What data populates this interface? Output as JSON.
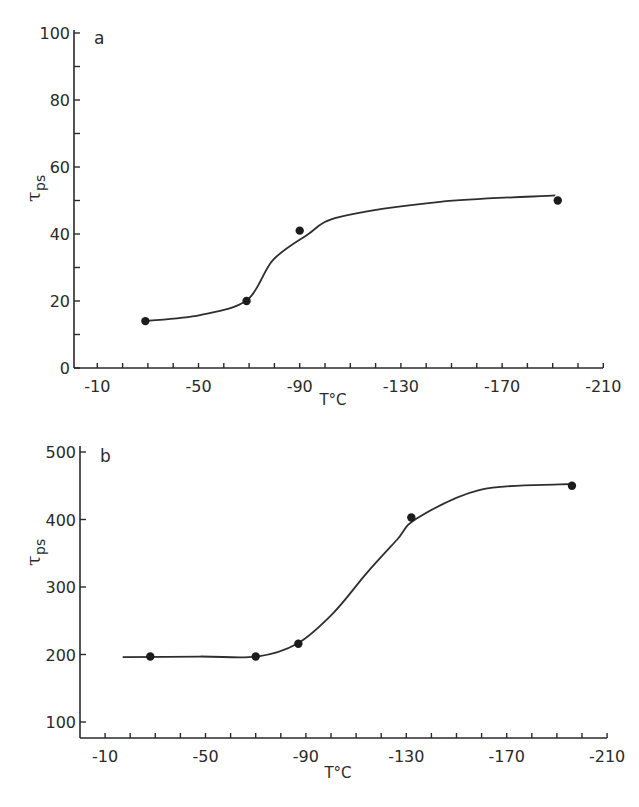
{
  "chart_data": [
    {
      "type": "scatter",
      "panel_label": "a",
      "title": "",
      "xlabel": "T°C",
      "ylabel": "τ",
      "ylabel_subscript": "ps",
      "xlim": [
        0,
        -210
      ],
      "ylim": [
        0,
        100
      ],
      "x_ticks_major": [
        -10,
        -50,
        -90,
        -130,
        -170,
        -210
      ],
      "x_tick_labels": [
        "-10",
        "-50",
        "-90",
        "-130",
        "-170",
        "-210"
      ],
      "x_ticks_minor_step": -10,
      "y_ticks_major": [
        0,
        20,
        40,
        60,
        80,
        100
      ],
      "y_tick_labels": [
        "0",
        "20",
        "40",
        "60",
        "80",
        "100"
      ],
      "y_ticks_minor_step": 10,
      "grid": false,
      "points": [
        {
          "x": -29,
          "y": 14
        },
        {
          "x": -69,
          "y": 20
        },
        {
          "x": -90,
          "y": 41
        },
        {
          "x": -192,
          "y": 50
        }
      ],
      "fit_curve": [
        {
          "x": -29,
          "y": 14
        },
        {
          "x": -50.6,
          "y": 15.8
        },
        {
          "x": -69.2,
          "y": 20.3
        },
        {
          "x": -79.4,
          "y": 32.2
        },
        {
          "x": -92.9,
          "y": 39.7
        },
        {
          "x": -105.9,
          "y": 45.1
        },
        {
          "x": -145.5,
          "y": 49.6
        },
        {
          "x": -191,
          "y": 51.5
        }
      ]
    },
    {
      "type": "scatter",
      "panel_label": "b",
      "title": "",
      "xlabel": "T°C",
      "ylabel": "τ",
      "ylabel_subscript": "ps",
      "xlim": [
        0,
        -210
      ],
      "ylim": [
        76,
        500
      ],
      "x_ticks_major": [
        -10,
        -50,
        -90,
        -130,
        -170,
        -210
      ],
      "x_tick_labels": [
        "-10",
        "-50",
        "-90",
        "-130",
        "-170",
        "-210"
      ],
      "x_ticks_minor_step": -10,
      "y_ticks_major": [
        100,
        200,
        300,
        400,
        500
      ],
      "y_tick_labels": [
        "100",
        "200",
        "300",
        "400",
        "500"
      ],
      "grid": false,
      "points": [
        {
          "x": -28,
          "y": 197
        },
        {
          "x": -70,
          "y": 197
        },
        {
          "x": -87,
          "y": 216
        },
        {
          "x": -132,
          "y": 403
        },
        {
          "x": -196,
          "y": 450
        }
      ],
      "fit_curve": [
        {
          "x": -17,
          "y": 196
        },
        {
          "x": -47.8,
          "y": 197
        },
        {
          "x": -70.5,
          "y": 197
        },
        {
          "x": -86.5,
          "y": 216
        },
        {
          "x": -100.8,
          "y": 261
        },
        {
          "x": -114.3,
          "y": 321
        },
        {
          "x": -126.3,
          "y": 370
        },
        {
          "x": -134.3,
          "y": 402
        },
        {
          "x": -159.4,
          "y": 444
        },
        {
          "x": -191.2,
          "y": 452
        },
        {
          "x": -196,
          "y": 452
        }
      ]
    }
  ]
}
